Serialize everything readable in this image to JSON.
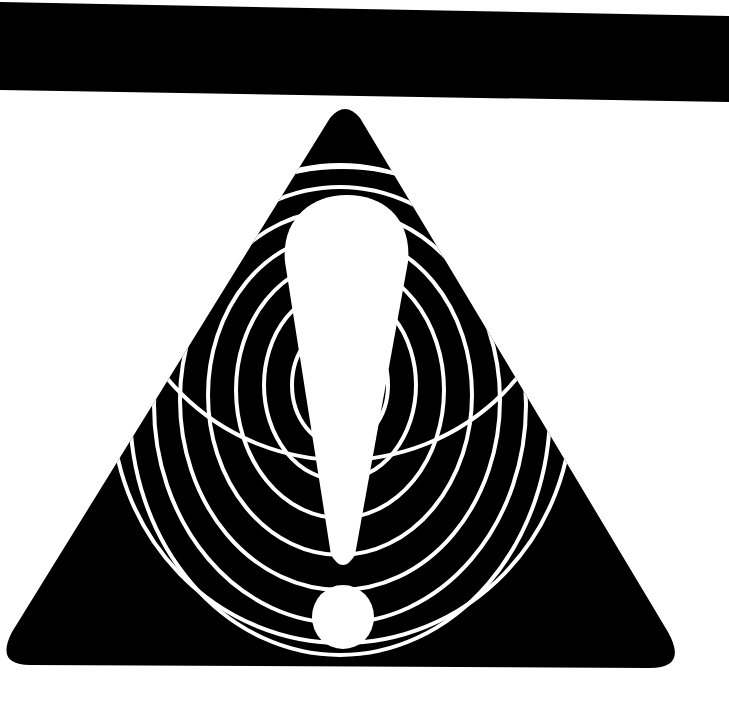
{
  "graphic": {
    "subject": "warning sign",
    "background_color": "#ffffff",
    "ink_color": "#000000",
    "symbol_color": "#ffffff",
    "elements": {
      "top_bar": "black horizontal bar",
      "triangle": "rounded black warning triangle",
      "rings": "concentric white rings",
      "exclamation": "white exclamation mark"
    },
    "ring_count": 9
  }
}
